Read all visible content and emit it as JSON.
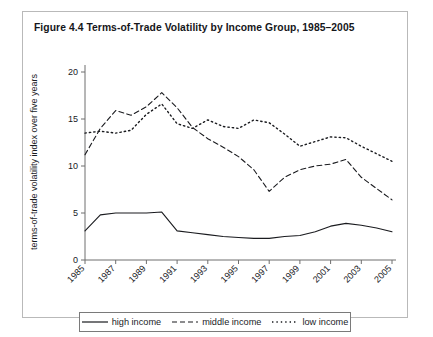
{
  "figure": {
    "title": "Figure 4.4  Terms-of-Trade Volatility by Income Group, 1985–2005"
  },
  "legend": {
    "items": [
      {
        "label": "high income",
        "style": "solid",
        "swatch": "solid-line-swatch"
      },
      {
        "label": "middle income",
        "style": "dashed",
        "swatch": "dashed-line-swatch"
      },
      {
        "label": "low income",
        "style": "dotted",
        "swatch": "dotted-line-swatch"
      }
    ]
  },
  "chart_data": {
    "type": "line",
    "title": "Figure 4.4  Terms-of-Trade Volatility by Income Group, 1985–2005",
    "xlabel": "year",
    "ylabel": "terms-of-trade volatility index over five years",
    "xlim": [
      1985,
      2005
    ],
    "ylim": [
      0,
      20
    ],
    "yticks": [
      0,
      5,
      10,
      15,
      20
    ],
    "ytick_labels": [
      "0",
      "5",
      "10",
      "15",
      "20"
    ],
    "xticks": [
      1985,
      1987,
      1989,
      1991,
      1993,
      1995,
      1997,
      1999,
      2001,
      2003,
      2005
    ],
    "xtick_labels": [
      "1985",
      "1987",
      "1989",
      "1991",
      "1993",
      "1995",
      "1997",
      "1999",
      "2001",
      "2003",
      "2005"
    ],
    "grid": false,
    "legend_position": "bottom",
    "x": [
      1985,
      1986,
      1987,
      1988,
      1989,
      1990,
      1991,
      1992,
      1993,
      1994,
      1995,
      1996,
      1997,
      1998,
      1999,
      2000,
      2001,
      2002,
      2003,
      2004,
      2005
    ],
    "series": [
      {
        "name": "high income",
        "style": "solid",
        "values": [
          3.1,
          4.8,
          5.0,
          5.0,
          5.0,
          5.1,
          3.1,
          2.9,
          2.7,
          2.5,
          2.4,
          2.3,
          2.3,
          2.5,
          2.6,
          3.0,
          3.6,
          3.9,
          3.7,
          3.4,
          3.0
        ]
      },
      {
        "name": "middle income",
        "style": "dashed",
        "values": [
          11.2,
          14.0,
          15.9,
          15.4,
          16.3,
          17.8,
          16.2,
          14.1,
          12.9,
          12.0,
          11.0,
          9.6,
          7.3,
          8.8,
          9.6,
          10.0,
          10.2,
          10.7,
          8.8,
          7.6,
          6.4
        ]
      },
      {
        "name": "low income",
        "style": "dotted",
        "values": [
          13.5,
          13.7,
          13.5,
          13.8,
          15.5,
          16.6,
          14.5,
          14.0,
          14.9,
          14.2,
          14.0,
          14.9,
          14.6,
          13.4,
          12.1,
          12.6,
          13.1,
          13.0,
          12.1,
          11.3,
          10.5
        ]
      }
    ]
  }
}
